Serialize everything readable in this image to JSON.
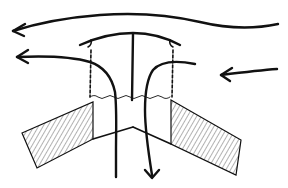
{
  "diagram": {
    "type": "line-drawing",
    "colors": {
      "ink": "#111111",
      "background": "#ffffff"
    },
    "elements": [
      {
        "name": "upper-wind-arrow",
        "direction": "left"
      },
      {
        "name": "lower-left-exhaust-arrow",
        "direction": "left"
      },
      {
        "name": "right-inflow-arrow",
        "direction": "left"
      },
      {
        "name": "down-flow-arrow",
        "direction": "down"
      },
      {
        "name": "vent-cap"
      },
      {
        "name": "vent-stem"
      },
      {
        "name": "left-roof-slab",
        "fill": "hatched"
      },
      {
        "name": "right-roof-slab",
        "fill": "hatched"
      }
    ]
  }
}
